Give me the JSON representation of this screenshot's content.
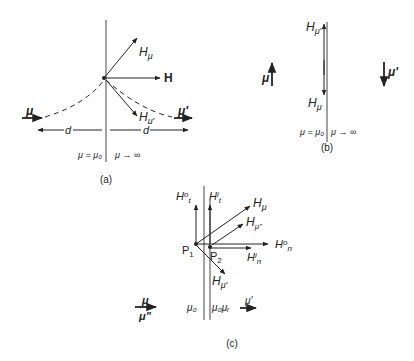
{
  "diagram": {
    "panel_a": {
      "caption": "(a)",
      "labels": {
        "h_mu": "H",
        "h_mu_sub": "μ",
        "h": "H",
        "h_mu_prime": "H",
        "h_mu_prime_sub": "μ'",
        "mu": "μ",
        "mu_prime": "μ'",
        "d_left": "d",
        "d_right": "d",
        "left_medium": "μ = μ₀",
        "right_medium": "μ → ∞"
      }
    },
    "panel_b": {
      "caption": "(b)",
      "labels": {
        "h_mu_prime": "H",
        "h_mu_prime_sub": "μ'",
        "h_mu": "H",
        "h_mu_sub": "μ",
        "mu": "μ",
        "mu_prime": "μ'",
        "left_medium": "μ = μ₀",
        "right_medium": "μ → ∞"
      }
    },
    "panel_c": {
      "caption": "(c)",
      "labels": {
        "h0t": "H",
        "h0t_sup": "o",
        "h0t_sub": "t",
        "hit": "H",
        "hit_sup": "i",
        "hit_sub": "t",
        "h_mu": "H",
        "h_mu_sub": "μ",
        "h_mu_dd": "H",
        "h_mu_dd_sub": "μ\"",
        "h0n": "H",
        "h0n_sup": "o",
        "h0n_sub": "n",
        "hin": "H",
        "hin_sup": "i",
        "hin_sub": "n",
        "p1": "P",
        "p1_sub": "1",
        "p2": "P",
        "p2_sub": "2",
        "h_mu_prime": "H",
        "h_mu_prime_sub": "μ'",
        "mu": "μ",
        "mu_dd": "μ\"",
        "mu_prime": "μ'",
        "left_medium": "μ₀",
        "right_medium": "μ₀μᵣ"
      }
    }
  }
}
